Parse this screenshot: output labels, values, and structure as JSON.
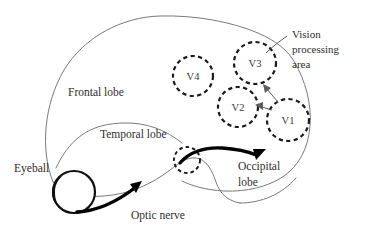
{
  "figure": {
    "background_color": "#ffffff",
    "ink_color": "#2e2e2e",
    "outline_color": "#7a7a7a",
    "accent_color": "#000000"
  },
  "labels": {
    "frontal_lobe": "Frontal lobe",
    "temporal_lobe": "Temporal lobe",
    "occipital_lobe_line1": "Occipital",
    "occipital_lobe_line2": "lobe",
    "eyeball": "Eyeball",
    "optic_nerve": "Optic nerve",
    "vision_area_line1": "Vision",
    "vision_area_line2": "processing",
    "vision_area_line3": "area"
  },
  "visual_areas": [
    {
      "id": "V4",
      "label": "V4",
      "cx": 193,
      "cy": 76,
      "r": 20
    },
    {
      "id": "V3",
      "label": "V3",
      "cx": 255,
      "cy": 63,
      "r": 21
    },
    {
      "id": "V2",
      "label": "V2",
      "cx": 238,
      "cy": 107,
      "r": 20
    },
    {
      "id": "V1",
      "label": "V1",
      "cx": 288,
      "cy": 120,
      "r": 21
    }
  ],
  "structures": [
    {
      "id": "brain",
      "name": "brain-outline"
    },
    {
      "id": "eyeball",
      "name": "eyeball"
    },
    {
      "id": "optic-chiasm",
      "name": "optic-chiasm-circle"
    },
    {
      "id": "optic-nerve-arrow",
      "name": "optic-nerve-arrow"
    },
    {
      "id": "tract-arrow",
      "name": "optic-tract-arrow"
    }
  ],
  "connectors": [
    {
      "from": "V1",
      "to": "V2",
      "name": "v1-to-v2-arrow"
    },
    {
      "from": "V1",
      "to": "V3",
      "name": "v1-to-v3-arrow"
    },
    {
      "from": "vision-processing-area",
      "to": "V3",
      "name": "vision-area-leader"
    }
  ]
}
